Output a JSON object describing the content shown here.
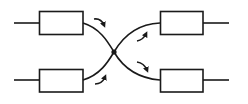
{
  "diagram": {
    "type": "crossing-connection",
    "stroke_color": "#1a1a1a",
    "background": "#ffffff",
    "blocks": [
      {
        "id": "top-left",
        "x": 39,
        "y": 11,
        "w": 44,
        "h": 24
      },
      {
        "id": "bottom-left",
        "x": 39,
        "y": 69,
        "w": 44,
        "h": 23
      },
      {
        "id": "top-right",
        "x": 160,
        "y": 11,
        "w": 43,
        "h": 24
      },
      {
        "id": "bottom-right",
        "x": 160,
        "y": 69,
        "w": 43,
        "h": 23
      }
    ],
    "junction": {
      "x": 114,
      "y": 52
    },
    "arrows": [
      {
        "id": "arrow-top-left",
        "direction": "down-right"
      },
      {
        "id": "arrow-bottom-left",
        "direction": "up-right"
      },
      {
        "id": "arrow-top-right",
        "direction": "up-right"
      },
      {
        "id": "arrow-bottom-right",
        "direction": "down-right"
      }
    ]
  }
}
